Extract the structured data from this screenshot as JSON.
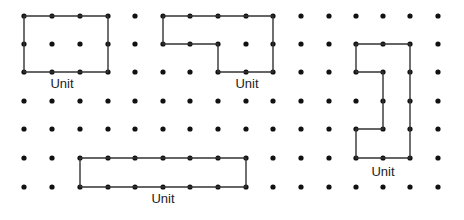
{
  "diagram": {
    "type": "dot-grid-shapes",
    "grid": {
      "cols": 16,
      "rows": 7,
      "x_positions": [
        24,
        52,
        80,
        108,
        135,
        163,
        190,
        218,
        246,
        273,
        301,
        329,
        356,
        383,
        410,
        438
      ],
      "y_positions": [
        16,
        44,
        72,
        101,
        129,
        158,
        187
      ],
      "dot_color": "#111111"
    },
    "shapes": [
      {
        "name": "rectangle-3x2",
        "label": "Unit",
        "points": [
          [
            0,
            0
          ],
          [
            3,
            0
          ],
          [
            3,
            2
          ],
          [
            0,
            2
          ]
        ],
        "label_pos": [
          62,
          88
        ]
      },
      {
        "name": "l-shape",
        "label": "Unit",
        "points": [
          [
            5,
            0
          ],
          [
            9,
            0
          ],
          [
            9,
            2
          ],
          [
            7,
            2
          ],
          [
            7,
            1
          ],
          [
            5,
            1
          ]
        ],
        "label_pos": [
          247,
          88
        ]
      },
      {
        "name": "vertical-notched-shape",
        "label": "Unit",
        "points": [
          [
            12,
            1
          ],
          [
            14,
            1
          ],
          [
            14,
            5
          ],
          [
            12,
            5
          ],
          [
            12,
            4
          ],
          [
            13,
            4
          ],
          [
            13,
            2
          ],
          [
            12,
            2
          ]
        ],
        "label_pos": [
          383,
          176
        ]
      },
      {
        "name": "rectangle-6x1",
        "label": "Unit",
        "points": [
          [
            2,
            5
          ],
          [
            8,
            5
          ],
          [
            8,
            6
          ],
          [
            2,
            6
          ]
        ],
        "label_pos": [
          163,
          203
        ]
      }
    ],
    "line_color": "#333333"
  }
}
